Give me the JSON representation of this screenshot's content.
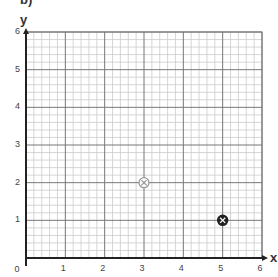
{
  "part_label": "b)",
  "chart_data": {
    "type": "scatter",
    "title": "",
    "xlabel": "x",
    "ylabel": "y",
    "xlim": [
      0,
      6
    ],
    "ylim": [
      0,
      6
    ],
    "x_ticks": [
      "0",
      "1",
      "2",
      "3",
      "4",
      "5",
      "6"
    ],
    "y_ticks": [
      "1",
      "2",
      "3",
      "4",
      "5",
      "6"
    ],
    "grid": true,
    "minor_divisions_per_unit": 5,
    "points": [
      {
        "x": 3,
        "y": 2,
        "marker": "circled-x",
        "color": "#999999",
        "style": "light"
      },
      {
        "x": 5,
        "y": 1,
        "marker": "circled-x",
        "color": "#222222",
        "style": "dark"
      }
    ]
  }
}
